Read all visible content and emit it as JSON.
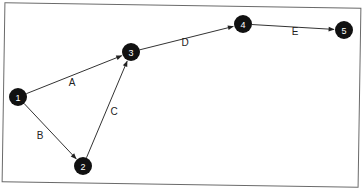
{
  "diagram": {
    "type": "network-graph",
    "nodes": [
      {
        "id": "1",
        "label": "1",
        "x": 18,
        "y": 97
      },
      {
        "id": "2",
        "label": "2",
        "x": 83,
        "y": 166
      },
      {
        "id": "3",
        "label": "3",
        "x": 131,
        "y": 52
      },
      {
        "id": "4",
        "label": "4",
        "x": 243,
        "y": 24
      },
      {
        "id": "5",
        "label": "5",
        "x": 344,
        "y": 30
      }
    ],
    "edges": [
      {
        "id": "A",
        "label": "A",
        "from": "1",
        "to": "3",
        "lx": 72,
        "ly": 86
      },
      {
        "id": "B",
        "label": "B",
        "from": "1",
        "to": "2",
        "lx": 40,
        "ly": 139
      },
      {
        "id": "C",
        "label": "C",
        "from": "2",
        "to": "3",
        "lx": 114,
        "ly": 115
      },
      {
        "id": "D",
        "label": "D",
        "from": "3",
        "to": "4",
        "lx": 185,
        "ly": 46
      },
      {
        "id": "E",
        "label": "E",
        "from": "4",
        "to": "5",
        "lx": 295,
        "ly": 35
      }
    ],
    "node_color": "#111111",
    "node_text_color": "#ffffff",
    "edge_color": "#333333"
  }
}
